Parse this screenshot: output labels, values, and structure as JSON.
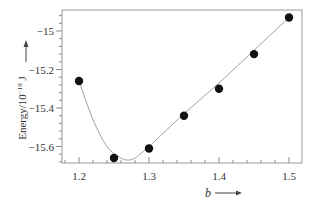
{
  "chart_data": {
    "type": "scatter",
    "title": "",
    "xlabel": "b",
    "ylabel": "Energy/10⁻¹⁹ J",
    "xlim": [
      1.18,
      1.52
    ],
    "ylim": [
      -15.71,
      -14.89
    ],
    "x_ticks": [
      "1.2",
      "1.3",
      "1.4",
      "1.5"
    ],
    "y_ticks": [
      "-15",
      "-15.2",
      "-15.4",
      "-15.6"
    ],
    "grid": false,
    "legend": null,
    "series": [
      {
        "name": "computed energy",
        "style": "markers",
        "x": [
          1.2,
          1.25,
          1.3,
          1.35,
          1.4,
          1.45,
          1.5
        ],
        "y": [
          -15.26,
          -15.66,
          -15.61,
          -15.44,
          -15.3,
          -15.12,
          -14.93
        ]
      },
      {
        "name": "fitted curve",
        "style": "line",
        "x": [
          1.2,
          1.22,
          1.24,
          1.26,
          1.27,
          1.28,
          1.3,
          1.35,
          1.4,
          1.45,
          1.5
        ],
        "y": [
          -15.26,
          -15.46,
          -15.6,
          -15.66,
          -15.67,
          -15.66,
          -15.6,
          -15.43,
          -15.27,
          -15.1,
          -14.93
        ]
      }
    ],
    "annotations": []
  },
  "labels": {
    "x_axis_title": "b",
    "y_axis_title_main": "Energy/10",
    "y_axis_title_exp": "−",
    "y_axis_title_exp_num": "19",
    "y_axis_title_unit": " J"
  }
}
